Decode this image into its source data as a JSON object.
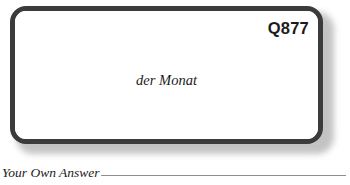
{
  "card": {
    "id_label": "Q877",
    "prompt_text": "der Monat",
    "border_color": "#3b3b3b",
    "background_color": "#ffffff"
  },
  "answer": {
    "label": "Your Own Answer",
    "rule_color": "#8e8e8e"
  }
}
